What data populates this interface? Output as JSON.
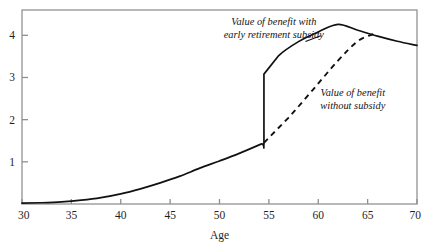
{
  "chart_data": {
    "type": "line",
    "title": "",
    "subtitle": "",
    "xlabel": "Age",
    "ylabel": "",
    "xlim": [
      30,
      70
    ],
    "ylim": [
      0,
      4.6
    ],
    "grid": false,
    "legend_position": "inline-annotations",
    "xticks": [
      30,
      35,
      40,
      45,
      50,
      55,
      60,
      65,
      70
    ],
    "xtick_labels": [
      "30",
      "35",
      "40",
      "45",
      "50",
      "55",
      "60",
      "65",
      "70"
    ],
    "yticks": [
      1,
      2,
      3,
      4
    ],
    "ytick_labels": [
      "1",
      "2",
      "3",
      "4"
    ],
    "series": [
      {
        "name": "Value of benefit with early retirement subsidy",
        "style": "solid",
        "color": "#111111",
        "x": [
          30,
          32,
          34,
          36,
          38,
          40,
          42,
          44,
          46,
          48,
          50,
          52,
          54.2,
          54.5,
          54.5,
          56,
          58,
          60,
          62,
          64,
          66,
          68,
          70
        ],
        "values": [
          0.02,
          0.03,
          0.05,
          0.09,
          0.15,
          0.24,
          0.36,
          0.5,
          0.66,
          0.85,
          1.02,
          1.2,
          1.42,
          1.45,
          3.08,
          3.52,
          3.85,
          4.08,
          4.26,
          4.12,
          3.98,
          3.86,
          3.76
        ]
      },
      {
        "name": "Value of benefit without subsidy",
        "style": "dashed",
        "color": "#111111",
        "x": [
          54.5,
          57,
          59.5,
          62,
          64,
          65.6
        ],
        "values": [
          1.45,
          2.05,
          2.72,
          3.4,
          3.86,
          4.03
        ]
      }
    ],
    "annotations": [
      {
        "id": "annotation-with-subsidy",
        "lines": [
          "Value of benefit with",
          "early retirement subsidy"
        ],
        "x": 55.5,
        "y": 4.25,
        "target_x": 58.5,
        "target_y": 3.9
      },
      {
        "id": "annotation-without-subsidy",
        "lines": [
          "Value of benefit",
          "without subsidy"
        ],
        "x": 63.5,
        "y": 2.55,
        "target_x": 60.5,
        "target_y": 2.9
      }
    ],
    "frame_color": "#9a9a9a",
    "axis_color": "#8f8f8f"
  }
}
